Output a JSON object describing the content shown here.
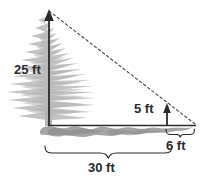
{
  "figure": {
    "type": "geometry-diagram",
    "background_color": "#ffffff"
  },
  "labels": {
    "tree_height": "25 ft",
    "post_height": "5 ft",
    "post_distance": "6 ft",
    "total_distance": "30 ft"
  },
  "colors": {
    "tree_foliage": "#c3c3c3",
    "tree_foliage_dark": "#b0b0b0",
    "shadow": "#9a9a9a",
    "line": "#2b2b2b",
    "dashed_line": "#4a4a4a",
    "text": "#2b2b2b"
  },
  "geometry": {
    "tree_arrow": {
      "x": 49,
      "y_base": 125,
      "y_tip": 10,
      "label": "25 ft"
    },
    "post_arrow": {
      "x": 167,
      "y_base": 125,
      "y_tip": 104,
      "label": "5 ft"
    },
    "ground_line": {
      "x_start": 48,
      "x_end": 196,
      "y": 125
    },
    "sight_line": {
      "x1": 49,
      "y1": 11,
      "x2": 195,
      "y2": 124,
      "style": "dashed"
    },
    "brace_total": {
      "x_start": 45,
      "x_end": 172,
      "y": 148,
      "label": "30 ft"
    },
    "brace_post": {
      "x_start": 166,
      "x_end": 195,
      "y": 131,
      "label": "6 ft"
    }
  }
}
